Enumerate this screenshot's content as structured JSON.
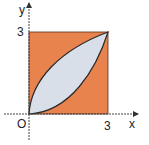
{
  "diagram": {
    "axes": {
      "x_label": "x",
      "y_label": "y",
      "origin_label": "O",
      "x_tick": "3",
      "y_tick": "3"
    },
    "square": {
      "from": [
        0,
        0
      ],
      "to": [
        3,
        3
      ],
      "color": "#E8834E"
    },
    "region": {
      "upper_curve": "y = sqrt(3x)",
      "lower_curve": "y = x^2/3",
      "color": "#D9DFE8"
    },
    "colors": {
      "axis": "#333333",
      "curve": "#2a2a2a"
    }
  }
}
